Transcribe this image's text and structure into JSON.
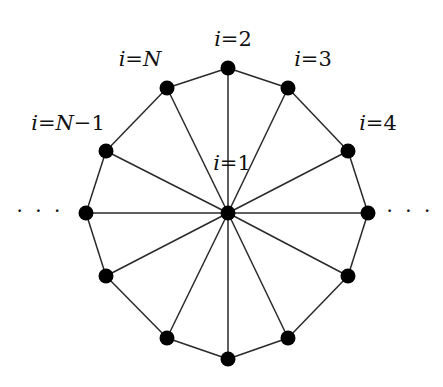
{
  "diagram": {
    "type": "wheel-graph",
    "colors": {
      "node": "#000000",
      "edge": "#2a2a2a",
      "text": "#111111",
      "background": "#ffffff"
    },
    "center": {
      "id": "1",
      "x": 228,
      "y": 213
    },
    "ring_nodes": [
      {
        "id": "2",
        "x": 228,
        "y": 68
      },
      {
        "id": "3",
        "x": 288,
        "y": 88
      },
      {
        "id": "4",
        "x": 348,
        "y": 151
      },
      {
        "id": "r5",
        "x": 368,
        "y": 213
      },
      {
        "id": "r6",
        "x": 348,
        "y": 276
      },
      {
        "id": "r7",
        "x": 288,
        "y": 338
      },
      {
        "id": "r8",
        "x": 228,
        "y": 359
      },
      {
        "id": "r9",
        "x": 167,
        "y": 338
      },
      {
        "id": "r10",
        "x": 106,
        "y": 276
      },
      {
        "id": "r11",
        "x": 86,
        "y": 213
      },
      {
        "id": "N-1",
        "x": 106,
        "y": 151
      },
      {
        "id": "N",
        "x": 167,
        "y": 88
      }
    ],
    "labels": [
      {
        "id": "label-i-2",
        "var": "i",
        "eq": "=",
        "val": "2",
        "x": 233,
        "y": 46
      },
      {
        "id": "label-i-N",
        "var": "i",
        "eq": "=",
        "val": "N",
        "x": 140,
        "y": 66
      },
      {
        "id": "label-i-3",
        "var": "i",
        "eq": "=",
        "val": "3",
        "x": 313,
        "y": 66
      },
      {
        "id": "label-i-N-1",
        "var": "i",
        "eq": "=",
        "val": "N−1",
        "x": 68,
        "y": 130
      },
      {
        "id": "label-i-4",
        "var": "i",
        "eq": "=",
        "val": "4",
        "x": 378,
        "y": 130
      },
      {
        "id": "label-i-1",
        "var": "i",
        "eq": "=",
        "val": "1",
        "x": 232,
        "y": 170
      }
    ],
    "ellipses": [
      {
        "id": "ellipsis-left",
        "text": "· · ·",
        "x": 40,
        "y": 218
      },
      {
        "id": "ellipsis-right",
        "text": "· · ·",
        "x": 410,
        "y": 218
      }
    ]
  }
}
